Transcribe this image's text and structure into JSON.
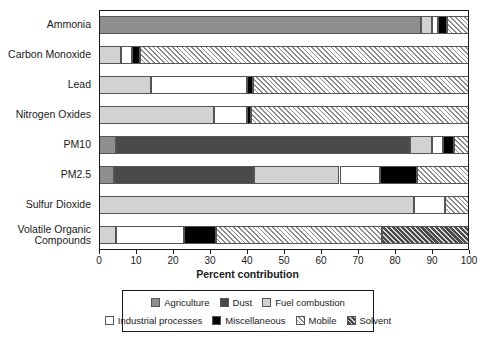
{
  "chart_data": {
    "type": "bar",
    "orientation": "horizontal",
    "stacked": true,
    "title": "",
    "xlabel": "Percent contribution",
    "ylabel": "",
    "xlim": [
      0,
      100
    ],
    "xticks": [
      0,
      10,
      20,
      30,
      40,
      50,
      60,
      70,
      80,
      90,
      100
    ],
    "xtick_labels": [
      "0",
      "10",
      "20",
      "30",
      "40",
      "50",
      "60",
      "70",
      "80",
      "90",
      "100"
    ],
    "grid": false,
    "legend_position": "bottom",
    "categories": [
      "Ammonia",
      "Carbon Monoxide",
      "Lead",
      "Nitrogen Oxides",
      "PM10",
      "PM2.5",
      "Sulfur Dioxide",
      "Volatile Organic\nCompounds"
    ],
    "series": [
      {
        "name": "Agriculture",
        "key": "agriculture",
        "color": "#8e8e8e",
        "values": [
          87,
          0,
          0,
          0,
          4.5,
          4,
          0,
          0
        ]
      },
      {
        "name": "Dust",
        "key": "dust",
        "color": "#4a4a4a",
        "values": [
          0,
          0,
          0,
          0,
          79.5,
          38,
          0,
          0
        ]
      },
      {
        "name": "Fuel combustion",
        "key": "fuel",
        "color": "#d2d2d2",
        "values": [
          3,
          6,
          14,
          31,
          6,
          23,
          85,
          4.5
        ]
      },
      {
        "name": "Industrial processes",
        "key": "industrial",
        "color": "#ffffff",
        "values": [
          1.5,
          3,
          26,
          9,
          3,
          11,
          8.5,
          18.5
        ]
      },
      {
        "name": "Miscellaneous",
        "key": "misc",
        "color": "#000000",
        "values": [
          2.5,
          2,
          1.5,
          1,
          3,
          10,
          0,
          8.5
        ]
      },
      {
        "name": "Mobile",
        "key": "mobile",
        "color": "hatch-light",
        "values": [
          6,
          89,
          58.5,
          59,
          4,
          14,
          6.5,
          45
        ]
      },
      {
        "name": "Solvent",
        "key": "solvent",
        "color": "hatch-dark",
        "values": [
          0,
          0,
          0,
          0,
          0,
          0,
          0,
          23.5
        ]
      }
    ]
  },
  "legend": {
    "row1": [
      {
        "label": "Agriculture",
        "key": "agriculture"
      },
      {
        "label": "Dust",
        "key": "dust"
      },
      {
        "label": "Fuel combustion",
        "key": "fuel"
      }
    ],
    "row2": [
      {
        "label": "Industrial processes",
        "key": "industrial"
      },
      {
        "label": "Miscellaneous",
        "key": "misc"
      },
      {
        "label": "Mobile",
        "key": "mobile"
      },
      {
        "label": "Solvent",
        "key": "solvent"
      }
    ]
  },
  "axis": {
    "x_title": "Percent contribution"
  }
}
